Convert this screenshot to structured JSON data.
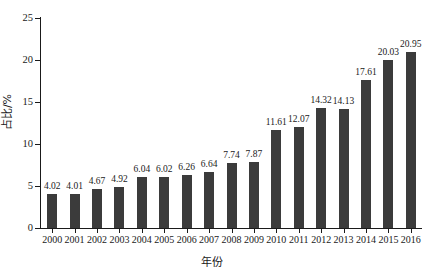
{
  "chart_data": {
    "type": "bar",
    "title": "",
    "subtitle": "",
    "xlabel": "年份",
    "ylabel": "占比/%",
    "categories": [
      "2000",
      "2001",
      "2002",
      "2003",
      "2004",
      "2005",
      "2006",
      "2007",
      "2008",
      "2009",
      "2010",
      "2011",
      "2012",
      "2013",
      "2014",
      "2015",
      "2016"
    ],
    "values": [
      4.02,
      4.01,
      4.67,
      4.92,
      6.04,
      6.02,
      6.26,
      6.64,
      7.74,
      7.87,
      11.61,
      12.07,
      14.32,
      14.13,
      17.61,
      20.03,
      20.95
    ],
    "value_labels": [
      "4.02",
      "4.01",
      "4.67",
      "4.92",
      "6.04",
      "6.02",
      "6.26",
      "6.64",
      "7.74",
      "7.87",
      "11.61",
      "12.07",
      "14.32",
      "14.13",
      "17.61",
      "20.03",
      "20.95"
    ],
    "ylim": [
      0,
      25
    ],
    "yticks": [
      0,
      5,
      10,
      15,
      20,
      25
    ],
    "ytick_labels": [
      "0",
      "5",
      "10",
      "15",
      "20",
      "25"
    ],
    "grid": false,
    "legend": null,
    "bar_color": "#3b3b3b",
    "axis_color": "#1a1a1a",
    "background": "#ffffff",
    "series": [
      {
        "name": "占比/%",
        "values": [
          4.02,
          4.01,
          4.67,
          4.92,
          6.04,
          6.02,
          6.26,
          6.64,
          7.74,
          7.87,
          11.61,
          12.07,
          14.32,
          14.13,
          17.61,
          20.03,
          20.95
        ]
      }
    ]
  }
}
